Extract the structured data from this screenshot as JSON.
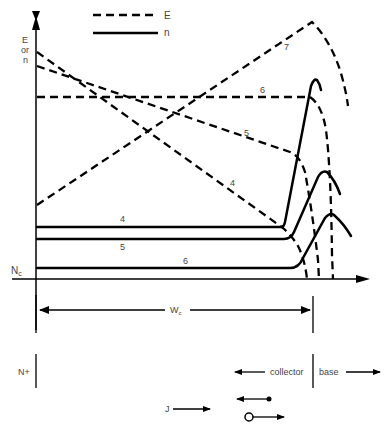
{
  "legend": {
    "dashed_label": "E",
    "solid_label": "n"
  },
  "axes": {
    "y_label_line1": "E",
    "y_label_line2": "or",
    "y_label_line3": "n",
    "nc_label": "N",
    "nc_sub": "c"
  },
  "curve_labels": {
    "E7": "7",
    "E6": "6",
    "E5": "5",
    "E4": "4",
    "n4": "4",
    "n5": "5",
    "n6": "6"
  },
  "dimension": {
    "label": "W",
    "sub": "c"
  },
  "regions": {
    "left": "N+",
    "collector": "collector",
    "base": "base"
  },
  "current": {
    "label": "J"
  },
  "colors": {
    "ink": "#000000",
    "text": "#444444"
  }
}
